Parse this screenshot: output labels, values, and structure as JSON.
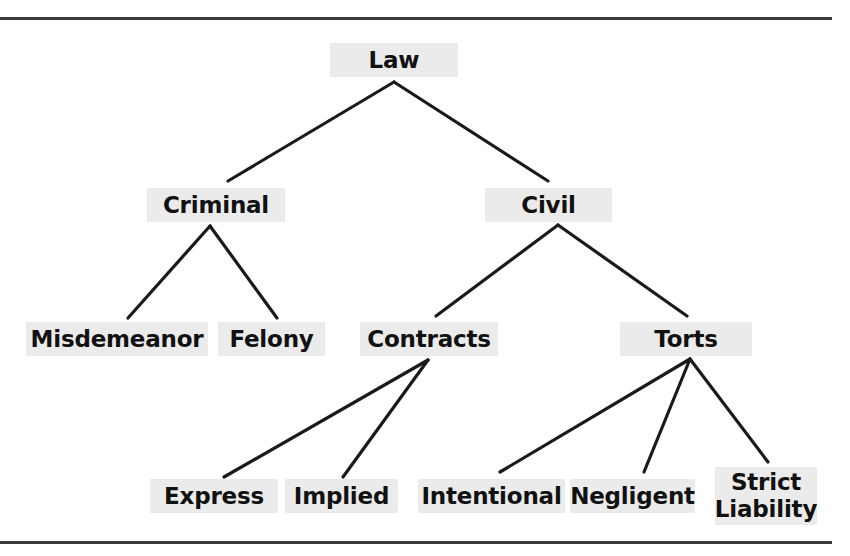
{
  "diagram": {
    "type": "hierarchy-tree",
    "title": "Law",
    "orientation": "top-down",
    "levels": 4,
    "colors": {
      "node_fill": "#ebebeb",
      "node_text": "#111111",
      "edge_stroke": "#1a1a1a",
      "rule_stroke": "#3a3a3a",
      "background": "#ffffff"
    },
    "rules": [
      {
        "name": "top-rule",
        "y": 17,
        "x": 0,
        "width": 832,
        "height": 3
      },
      {
        "name": "bottom-rule",
        "y": 541,
        "x": 0,
        "width": 832,
        "height": 3
      }
    ],
    "nodes": [
      {
        "id": "law",
        "label": "Law",
        "level": 0,
        "x": 330,
        "y": 43,
        "w": 128,
        "h": 34,
        "cx": 394,
        "lines": 1
      },
      {
        "id": "criminal",
        "label": "Criminal",
        "level": 1,
        "x": 147,
        "y": 188,
        "w": 138,
        "h": 34,
        "cx": 210,
        "lines": 1
      },
      {
        "id": "civil",
        "label": "Civil",
        "level": 1,
        "x": 485,
        "y": 188,
        "w": 127,
        "h": 34,
        "cx": 558,
        "lines": 1
      },
      {
        "id": "misdemeanor",
        "label": "Misdemeanor",
        "level": 2,
        "x": 26,
        "y": 322,
        "w": 182,
        "h": 34,
        "cx": 117,
        "lines": 1
      },
      {
        "id": "felony",
        "label": "Felony",
        "level": 2,
        "x": 218,
        "y": 322,
        "w": 107,
        "h": 34,
        "cx": 271,
        "lines": 1
      },
      {
        "id": "contracts",
        "label": "Contracts",
        "level": 2,
        "x": 360,
        "y": 322,
        "w": 138,
        "h": 34,
        "cx": 428,
        "lines": 1
      },
      {
        "id": "torts",
        "label": "Torts",
        "level": 2,
        "x": 620,
        "y": 322,
        "w": 132,
        "h": 34,
        "cx": 690,
        "lines": 1
      },
      {
        "id": "express",
        "label": "Express",
        "level": 3,
        "x": 150,
        "y": 479,
        "w": 128,
        "h": 34,
        "cx": 214,
        "lines": 1
      },
      {
        "id": "implied",
        "label": "Implied",
        "level": 3,
        "x": 285,
        "y": 479,
        "w": 113,
        "h": 34,
        "cx": 341,
        "lines": 1
      },
      {
        "id": "intentional",
        "label": "Intentional",
        "level": 3,
        "x": 418,
        "y": 479,
        "w": 147,
        "h": 34,
        "cx": 491,
        "lines": 1
      },
      {
        "id": "negligent",
        "label": "Negligent",
        "level": 3,
        "x": 570,
        "y": 479,
        "w": 125,
        "h": 34,
        "cx": 632,
        "lines": 1
      },
      {
        "id": "strict",
        "label": "Strict\nLiability",
        "level": 3,
        "x": 715,
        "y": 467,
        "w": 102,
        "h": 58,
        "cx": 766,
        "lines": 2
      }
    ],
    "edges": [
      {
        "from": "law",
        "to": "criminal",
        "x1": 394,
        "y1": 82,
        "x2": 228,
        "y2": 181
      },
      {
        "from": "law",
        "to": "civil",
        "x1": 394,
        "y1": 82,
        "x2": 548,
        "y2": 181
      },
      {
        "from": "criminal",
        "to": "misdemeanor",
        "x1": 210,
        "y1": 226,
        "x2": 128,
        "y2": 318
      },
      {
        "from": "criminal",
        "to": "felony",
        "x1": 210,
        "y1": 226,
        "x2": 277,
        "y2": 318
      },
      {
        "from": "civil",
        "to": "contracts",
        "x1": 558,
        "y1": 225,
        "x2": 436,
        "y2": 316
      },
      {
        "from": "civil",
        "to": "torts",
        "x1": 558,
        "y1": 225,
        "x2": 687,
        "y2": 316
      },
      {
        "from": "contracts",
        "to": "express",
        "x1": 428,
        "y1": 360,
        "x2": 224,
        "y2": 477
      },
      {
        "from": "contracts",
        "to": "implied",
        "x1": 428,
        "y1": 360,
        "x2": 343,
        "y2": 477
      },
      {
        "from": "torts",
        "to": "intentional",
        "x1": 690,
        "y1": 359,
        "x2": 500,
        "y2": 472
      },
      {
        "from": "torts",
        "to": "negligent",
        "x1": 690,
        "y1": 359,
        "x2": 644,
        "y2": 472
      },
      {
        "from": "torts",
        "to": "strict",
        "x1": 690,
        "y1": 359,
        "x2": 768,
        "y2": 462
      }
    ]
  }
}
